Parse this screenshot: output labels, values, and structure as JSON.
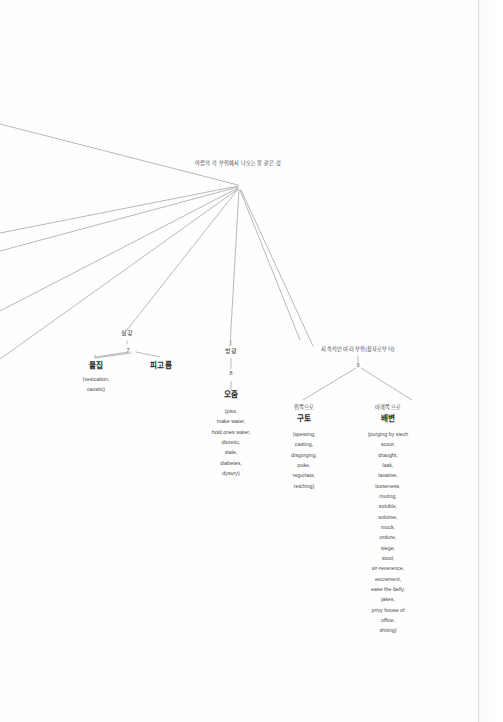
{
  "diagram": {
    "type": "semantic-tree",
    "root": {
      "label": "마렵의 각 부위에서 나오는 물 같은 것",
      "x": 238,
      "y": 166
    },
    "branches": [
      {
        "id": "skin",
        "category": "살갗",
        "node_number": "7",
        "children": [
          {
            "label": "물집",
            "gloss": [
              "(vesication,",
              "caustic)"
            ]
          },
          {
            "label": "피고름",
            "gloss": []
          }
        ]
      },
      {
        "id": "bladder",
        "category": "방광",
        "node_number": "8",
        "children": [
          {
            "label": "오줌",
            "gloss": [
              "(piss,",
              "make water,",
              "hold ones water,",
              "diuretic,",
              "stale,",
              "diabetes,",
              "dysury)"
            ]
          }
        ]
      },
      {
        "id": "continuous",
        "category": "지속적인 여러 부위(창자로부터)",
        "node_number": "9",
        "children": [
          {
            "direction": "위쪽으로",
            "label": "구토",
            "gloss": [
              "(spewing,",
              "casting,",
              "disgorging,",
              "puke,",
              "regurtate,",
              "retching)"
            ]
          },
          {
            "direction": "아래쪽으로",
            "label": "배변",
            "gloss": [
              "(purging by siech",
              "scour,",
              "draught,",
              "lask,",
              "laxative,",
              "looseness,",
              "muting,",
              "soluble,",
              "solutive,",
              "muck,",
              "ordure,",
              "siege,",
              "stool,",
              "sir-reverence,",
              "excrement,",
              "ease the belly,",
              "jakes,",
              "privy house of",
              "office,",
              "shiting)"
            ]
          }
        ]
      }
    ],
    "colors": {
      "line": "#8a8a8a",
      "text": "#3d3d3d",
      "text_bold": "#2c2c2c",
      "background": "#fefefe",
      "page_edge": "#d9d9d9"
    }
  }
}
